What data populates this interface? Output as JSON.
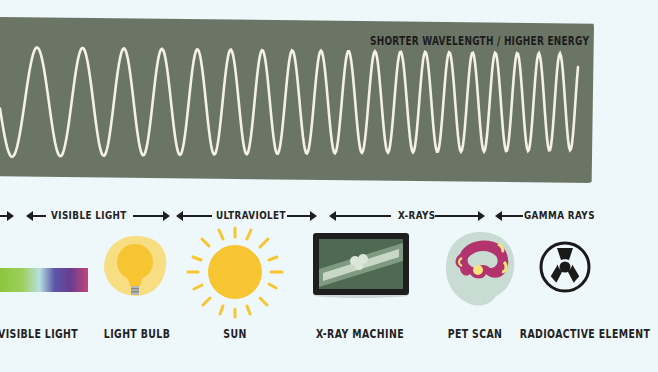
{
  "panel": {
    "title": "SHORTER WAVELENGTH / HIGHER ENERGY",
    "background_color": "#6b7566",
    "wave_color": "#f4f1e6"
  },
  "bands": [
    {
      "label": "VISIBLE LIGHT"
    },
    {
      "label": "ULTRAVIOLET"
    },
    {
      "label": "X-RAYS"
    },
    {
      "label": "GAMMA RAYS"
    }
  ],
  "items": [
    {
      "label": "VISIBLE LIGHT",
      "icon": "color-spectrum-icon"
    },
    {
      "label": "LIGHT BULB",
      "icon": "light-bulb-icon"
    },
    {
      "label": "SUN",
      "icon": "sun-icon"
    },
    {
      "label": "X-RAY MACHINE",
      "icon": "xray-machine-icon"
    },
    {
      "label": "PET SCAN",
      "icon": "pet-scan-brain-icon"
    },
    {
      "label": "RADIOACTIVE ELEMENT",
      "icon": "radiation-icon"
    }
  ],
  "colors": {
    "background": "#eef7f9",
    "text": "#222222",
    "sun": "#f7c531",
    "bulb": "#f8cf45",
    "xray_frame": "#1e1e1e",
    "xray_screen": "#4f6a52",
    "pet_purple": "#b2336e",
    "pet_yellow": "#f5e27a"
  }
}
